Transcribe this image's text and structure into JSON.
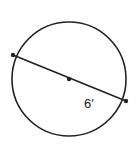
{
  "diagram": {
    "type": "circle-diameter",
    "circle": {
      "cx": 69,
      "cy": 79,
      "r": 57
    },
    "diameter": {
      "x1": 13,
      "y1": 55,
      "x2": 126,
      "y2": 101
    },
    "center_point": {
      "x": 69,
      "y": 79
    },
    "segment_label": "6′",
    "colors": {
      "stroke": "#222222",
      "background": "#ffffff"
    }
  }
}
